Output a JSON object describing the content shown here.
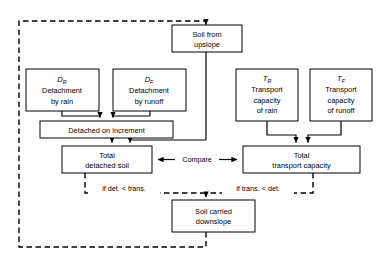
{
  "diagram": {
    "colors": {
      "stroke": "#000000",
      "fill": "#ffffff",
      "background": "#ffffff"
    },
    "nodes": [
      {
        "id": "soil_upslope",
        "name": "soil-from-upslope",
        "line1": "Soil from",
        "line2": "upslope",
        "x": 172,
        "y": 25,
        "w": 70,
        "h": 27
      },
      {
        "id": "d_rain",
        "name": "detachment-by-rain",
        "symbol": "D",
        "sub": "R",
        "line1": "Detachment",
        "line2": "by rain",
        "x": 26,
        "y": 69,
        "w": 73,
        "h": 42
      },
      {
        "id": "d_runoff",
        "name": "detachment-by-runoff",
        "symbol": "D",
        "sub": "F",
        "line1": "Detachment",
        "line2": "by runoff",
        "x": 113,
        "y": 69,
        "w": 73,
        "h": 42
      },
      {
        "id": "t_rain",
        "name": "transport-capacity-rain",
        "symbol": "T",
        "sub": "R",
        "line1": "Transport",
        "line2": "capacity",
        "line3": "of rain",
        "x": 236,
        "y": 69,
        "w": 62,
        "h": 52
      },
      {
        "id": "t_runoff",
        "name": "transport-capacity-runoff",
        "symbol": "T",
        "sub": "F",
        "line1": "Transport",
        "line2": "capacity",
        "line3": "of runoff",
        "x": 310,
        "y": 69,
        "w": 62,
        "h": 52
      },
      {
        "id": "detached_inc",
        "name": "detached-on-increment",
        "line1": "Detached on increment",
        "x": 40,
        "y": 121,
        "w": 133,
        "h": 17
      },
      {
        "id": "total_detached",
        "name": "total-detached-soil",
        "line1": "Total",
        "line2": "detached soil",
        "x": 62,
        "y": 146,
        "w": 90,
        "h": 27
      },
      {
        "id": "total_transport",
        "name": "total-transport-capacity",
        "line1": "Total",
        "line2": "transport capacity",
        "x": 243,
        "y": 146,
        "w": 117,
        "h": 27
      },
      {
        "id": "soil_downslope",
        "name": "soil-carried-downslope",
        "line1": "Soil carried",
        "line2": "downslope",
        "x": 172,
        "y": 200,
        "w": 83,
        "h": 32
      }
    ],
    "edge_labels": [
      {
        "id": "compare",
        "name": "compare-label",
        "text": "Compare",
        "x": 197,
        "y": 159
      },
      {
        "id": "det_lt_tr",
        "name": "if-det-lt-trans-label",
        "text": "if det. < trans.",
        "x": 123,
        "y": 188
      },
      {
        "id": "tr_lt_det",
        "name": "if-trans-lt-det-label",
        "text": "if trans. < det.",
        "x": 257,
        "y": 188
      }
    ]
  }
}
